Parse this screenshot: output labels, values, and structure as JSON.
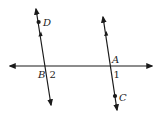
{
  "diagram": {
    "colors": {
      "line": "#1a1a1a",
      "text": "#222222",
      "background": "#ffffff"
    },
    "transversal": {
      "label": "horizontal line"
    },
    "lines": [
      {
        "name": "left-line",
        "points": [
          "D",
          "B"
        ],
        "parallel_mark": "single-arrow"
      },
      {
        "name": "right-line",
        "points": [
          "A",
          "C"
        ],
        "parallel_mark": "single-arrow"
      }
    ],
    "points": {
      "D": "D",
      "B": "B",
      "A": "A",
      "C": "C"
    },
    "angles": {
      "angle1": "1",
      "angle2": "2"
    }
  }
}
